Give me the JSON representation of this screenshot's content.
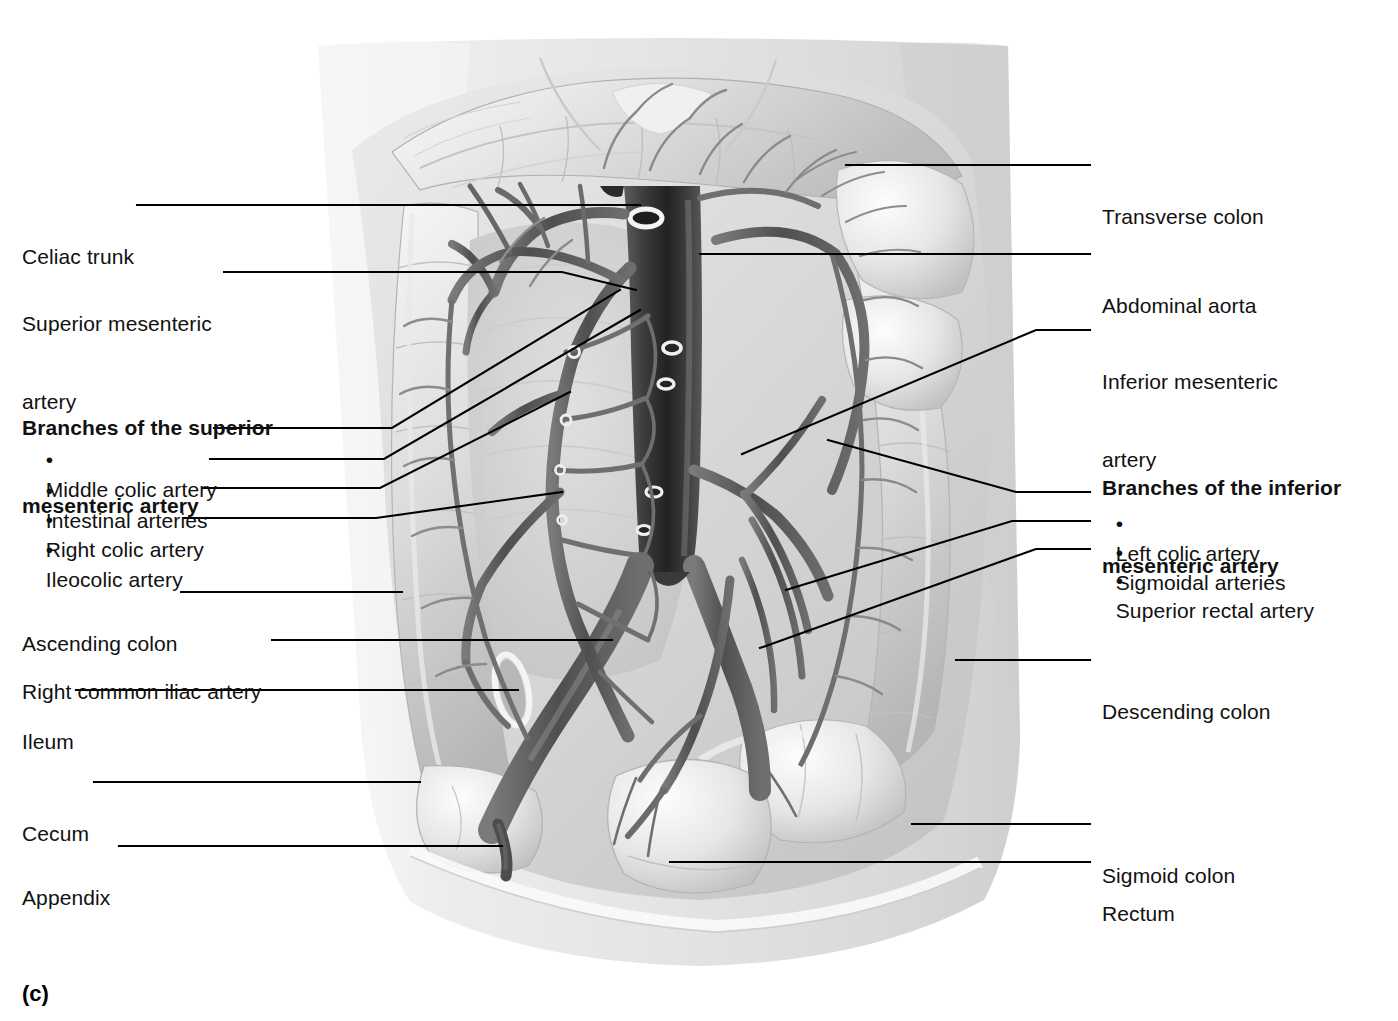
{
  "figure": {
    "caption": "(c)"
  },
  "labels_left": [
    {
      "id": "celiac-trunk",
      "text": "Celiac trunk",
      "lines": [
        "Celiac trunk"
      ]
    },
    {
      "id": "superior-mesenteric-artery",
      "text": "Superior mesenteric artery",
      "lines": [
        "Superior mesenteric",
        "artery"
      ]
    },
    {
      "id": "ascending-colon",
      "text": "Ascending colon",
      "lines": [
        "Ascending colon"
      ]
    },
    {
      "id": "right-common-iliac-artery",
      "text": "Right common iliac artery",
      "lines": [
        "Right common iliac artery"
      ]
    },
    {
      "id": "ileum",
      "text": "Ileum",
      "lines": [
        "Ileum"
      ]
    },
    {
      "id": "cecum",
      "text": "Cecum",
      "lines": [
        "Cecum"
      ]
    },
    {
      "id": "appendix",
      "text": "Appendix",
      "lines": [
        "Appendix"
      ]
    }
  ],
  "group_left": {
    "id": "branches-superior-mesenteric-artery",
    "heading_lines": [
      "Branches of the superior",
      "mesenteric artery"
    ],
    "items": [
      {
        "id": "middle-colic-artery",
        "bullet": "•",
        "text": "Middle colic artery"
      },
      {
        "id": "intestinal-arteries",
        "bullet": "•",
        "text": "Intestinal arteries"
      },
      {
        "id": "right-colic-artery",
        "bullet": "•",
        "text": "Right colic artery"
      },
      {
        "id": "ileocolic-artery",
        "bullet": "•",
        "text": "Ileocolic artery"
      }
    ]
  },
  "labels_right": [
    {
      "id": "transverse-colon",
      "text": "Transverse colon",
      "lines": [
        "Transverse colon"
      ]
    },
    {
      "id": "abdominal-aorta",
      "text": "Abdominal aorta",
      "lines": [
        "Abdominal aorta"
      ]
    },
    {
      "id": "inferior-mesenteric-artery",
      "text": "Inferior mesenteric artery",
      "lines": [
        "Inferior mesenteric",
        "artery"
      ]
    },
    {
      "id": "descending-colon",
      "text": "Descending colon",
      "lines": [
        "Descending colon"
      ]
    },
    {
      "id": "sigmoid-colon",
      "text": "Sigmoid colon",
      "lines": [
        "Sigmoid colon"
      ]
    },
    {
      "id": "rectum",
      "text": "Rectum",
      "lines": [
        "Rectum"
      ]
    }
  ],
  "group_right": {
    "id": "branches-inferior-mesenteric-artery",
    "heading_lines": [
      "Branches of the inferior",
      "mesenteric artery"
    ],
    "items": [
      {
        "id": "left-colic-artery",
        "bullet": "•",
        "text": "Left colic artery"
      },
      {
        "id": "sigmoidal-arteries",
        "bullet": "•",
        "text": "Sigmoidal arteries"
      },
      {
        "id": "superior-rectal-artery",
        "bullet": "•",
        "text": "Superior rectal artery"
      }
    ]
  },
  "colors": {
    "text": "#111111",
    "leader": "#000000",
    "background": "#ffffff",
    "torso_light": "#f2f2f2",
    "tissue_mid": "#c9c9c9",
    "tissue_shadow": "#9d9d9d",
    "vessel_dark": "#4a4a4a",
    "vessel_darkest": "#262626",
    "highlight": "#fbfbfb"
  }
}
